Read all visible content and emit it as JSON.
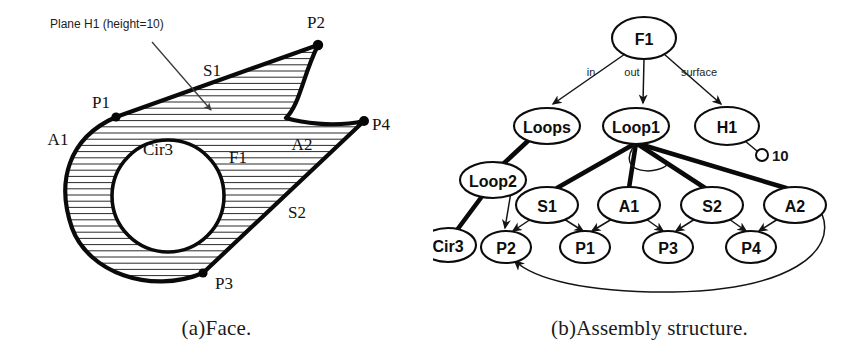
{
  "figure": {
    "panels": [
      {
        "id": "face",
        "caption": "(a)Face.",
        "annotation": "Plane  H1  (height=10)",
        "labels": {
          "p1": "P1",
          "p2": "P2",
          "p3": "P3",
          "p4": "P4",
          "a1": "A1",
          "a2": "A2",
          "s1": "S1",
          "s2": "S2",
          "f1": "F1",
          "cir3": "Cir3"
        }
      },
      {
        "id": "assembly",
        "caption": "(b)Assembly structure.",
        "nodes": [
          {
            "key": "F1",
            "label": "F1",
            "cx": 211,
            "cy": 38,
            "rx": 32,
            "ry": 21
          },
          {
            "key": "Loops",
            "label": "Loops",
            "cx": 114,
            "cy": 126,
            "rx": 33,
            "ry": 18
          },
          {
            "key": "Loop1",
            "label": "Loop1",
            "cx": 203,
            "cy": 126,
            "rx": 33,
            "ry": 18
          },
          {
            "key": "H1",
            "label": "H1",
            "cx": 294,
            "cy": 126,
            "rx": 32,
            "ry": 19
          },
          {
            "key": "Loop2",
            "label": "Loop2",
            "cx": 60,
            "cy": 180,
            "rx": 33,
            "ry": 18
          },
          {
            "key": "S1",
            "label": "S1",
            "cx": 114,
            "cy": 205,
            "rx": 31,
            "ry": 18
          },
          {
            "key": "A1",
            "label": "A1",
            "cx": 196,
            "cy": 205,
            "rx": 31,
            "ry": 18
          },
          {
            "key": "S2",
            "label": "S2",
            "cx": 279,
            "cy": 205,
            "rx": 31,
            "ry": 18
          },
          {
            "key": "A2",
            "label": "A2",
            "cx": 362,
            "cy": 205,
            "rx": 31,
            "ry": 18
          },
          {
            "key": "Cir3",
            "label": "Cir3",
            "cx": 15,
            "cy": 245,
            "rx": 28,
            "ry": 17
          },
          {
            "key": "P2",
            "label": "P2",
            "cx": 73,
            "cy": 247,
            "rx": 25,
            "ry": 16
          },
          {
            "key": "P1",
            "label": "P1",
            "cx": 152,
            "cy": 247,
            "rx": 25,
            "ry": 16
          },
          {
            "key": "P3",
            "label": "P3",
            "cx": 235,
            "cy": 247,
            "rx": 25,
            "ry": 16
          },
          {
            "key": "P4",
            "label": "P4",
            "cx": 318,
            "cy": 247,
            "rx": 25,
            "ry": 16
          }
        ],
        "edge_labels": {
          "in": "in",
          "out": "out",
          "surface": "surface"
        },
        "height_value": "10"
      }
    ]
  },
  "colors": {
    "ink": "#0a0a0a",
    "hatch": "#2b2b2b",
    "paper": "#ffffff",
    "leader": "#3a3a3a"
  }
}
